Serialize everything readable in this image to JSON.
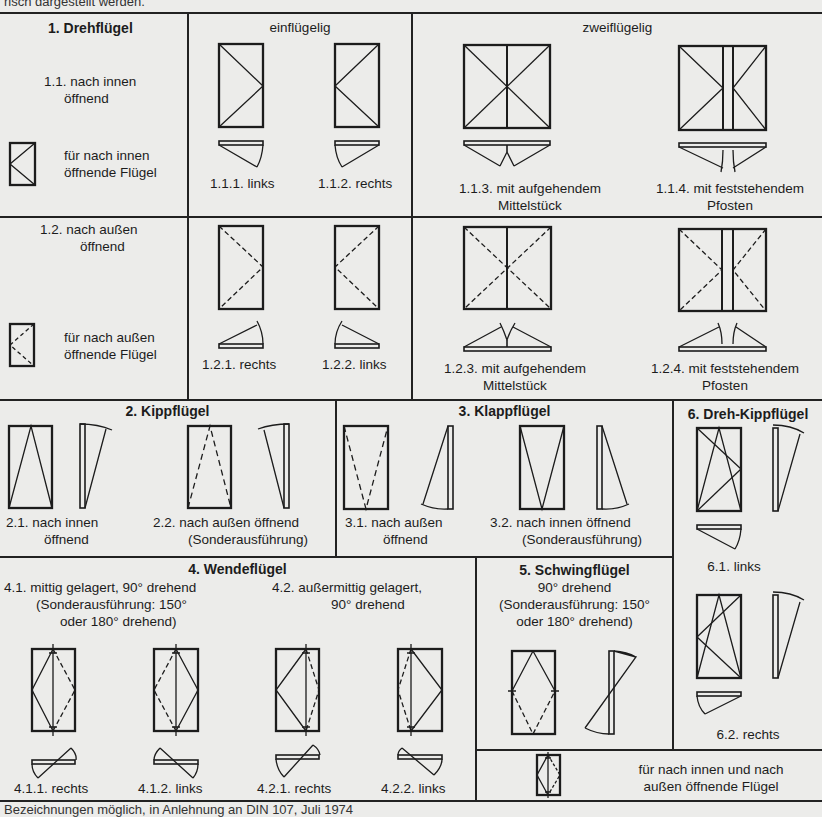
{
  "top_cut_text": "risch dargestellt werden.",
  "bottom_cut_text": "Bezeichnungen möglich, in Anlehnung an DIN 107, Juli 1974",
  "section1": {
    "title": "1. Drehflügel",
    "col_einfluegelig": "einflügelig",
    "col_zweifluegelig": "zweiflügelig",
    "row_inward": {
      "label_line1": "1.1. nach innen",
      "label_line2": "öffnend",
      "legend_line1": "für nach innen",
      "legend_line2": "öffnende Flügel",
      "items": [
        {
          "id": "1.1.1.",
          "label": "1.1.1. links"
        },
        {
          "id": "1.1.2.",
          "label": "1.1.2. rechts"
        },
        {
          "id": "1.1.3.",
          "label_line1": "1.1.3. mit aufgehendem",
          "label_line2": "Mittelstück"
        },
        {
          "id": "1.1.4.",
          "label_line1": "1.1.4. mit feststehendem",
          "label_line2": "Pfosten"
        }
      ]
    },
    "row_outward": {
      "label_line1": "1.2. nach außen",
      "label_line2": "öffnend",
      "legend_line1": "für nach außen",
      "legend_line2": "öffnende Flügel",
      "items": [
        {
          "id": "1.2.1.",
          "label": "1.2.1. rechts"
        },
        {
          "id": "1.2.2.",
          "label": "1.2.2. links"
        },
        {
          "id": "1.2.3.",
          "label_line1": "1.2.3. mit aufgehendem",
          "label_line2": "Mittelstück"
        },
        {
          "id": "1.2.4.",
          "label_line1": "1.2.4. mit feststehendem",
          "label_line2": "Pfosten"
        }
      ]
    }
  },
  "section2": {
    "title": "2. Kippflügel",
    "items": [
      {
        "label_line1": "2.1. nach innen",
        "label_line2": "öffnend"
      },
      {
        "label_line1": "2.2. nach außen öffnend",
        "label_line2": "(Sonderausführung)"
      }
    ]
  },
  "section3": {
    "title": "3. Klappflügel",
    "items": [
      {
        "label_line1": "3.1. nach außen",
        "label_line2": "öffnend"
      },
      {
        "label_line1": "3.2. nach innen öffnend",
        "label_line2": "(Sonderausführung)"
      }
    ]
  },
  "section4": {
    "title": "4. Wendeflügel",
    "sub1_line1": "4.1. mittig gelagert, 90° drehend",
    "sub1_line2": "(Sonderausführung: 150°",
    "sub1_line3": "oder 180° drehend)",
    "sub2_line1": "4.2. außermittig gelagert,",
    "sub2_line2": "90° drehend",
    "items": [
      {
        "label": "4.1.1. rechts"
      },
      {
        "label": "4.1.2. links"
      },
      {
        "label": "4.2.1. rechts"
      },
      {
        "label": "4.2.2. links"
      }
    ]
  },
  "section5": {
    "title": "5. Schwingflügel",
    "line1": "90° drehend",
    "line2": "(Sonderausführung: 150°",
    "line3": "oder 180° drehend)"
  },
  "section6": {
    "title": "6. Dreh-Kippflügel",
    "items": [
      {
        "label": "6.1. links"
      },
      {
        "label": "6.2. rechts"
      }
    ]
  },
  "legend_both": {
    "line1": "für nach innen und nach",
    "line2": "außen öffnende Flügel"
  },
  "colors": {
    "ink": "#1c1c1c",
    "paper": "#ececea"
  }
}
